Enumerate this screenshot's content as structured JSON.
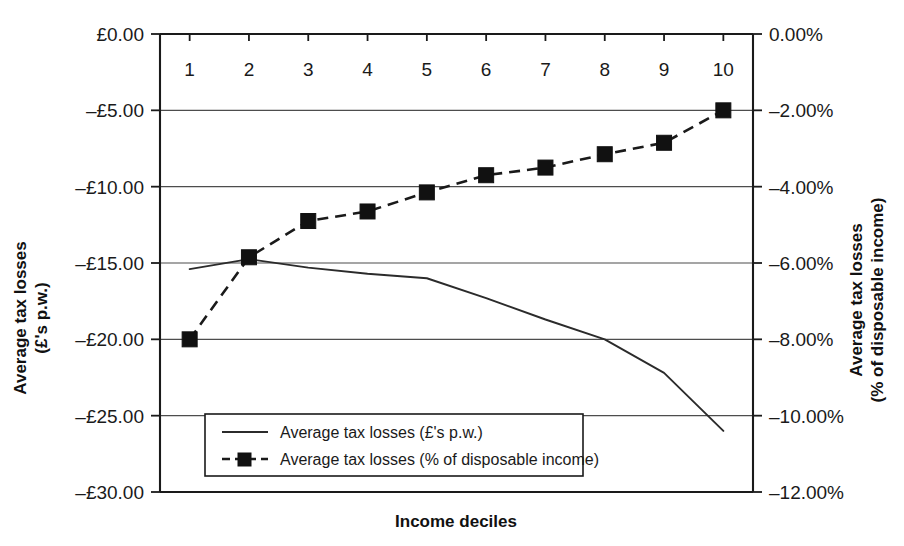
{
  "chart_data": {
    "type": "line",
    "title": "",
    "xlabel": "Income deciles",
    "categories": [
      "1",
      "2",
      "3",
      "4",
      "5",
      "6",
      "7",
      "8",
      "9",
      "10"
    ],
    "grid": true,
    "legend_position": "inside-bottom-left",
    "axes": {
      "left": {
        "label_line1": "Average tax losses",
        "label_line2": "(£'s p.w.)",
        "ylim": [
          -30.0,
          0.0
        ],
        "tick_values": [
          0.0,
          -5.0,
          -10.0,
          -15.0,
          -20.0,
          -25.0,
          -30.0
        ],
        "tick_labels": [
          "£0.00",
          "–£5.00",
          "–£10.00",
          "–£15.00",
          "–£20.00",
          "–£25.00",
          "–£30.00"
        ]
      },
      "right": {
        "label_line1": "Average tax losses",
        "label_line2": "(% of disposable income)",
        "ylim": [
          -12.0,
          0.0
        ],
        "tick_values": [
          0.0,
          -2.0,
          -4.0,
          -6.0,
          -8.0,
          -10.0,
          -12.0
        ],
        "tick_labels": [
          "0.00%",
          "–2.00%",
          "–4.00%",
          "–6.00%",
          "–8.00%",
          "–10.00%",
          "–12.00%"
        ]
      }
    },
    "series": [
      {
        "name": "Average tax losses (£'s p.w.)",
        "axis": "left",
        "style": "solid",
        "marker": "none",
        "color": "#2b2b2b",
        "x": [
          1,
          2,
          3,
          4,
          5,
          6,
          7,
          8,
          9,
          10
        ],
        "values": [
          -15.4,
          -14.75,
          -15.3,
          -15.7,
          -16.0,
          -17.3,
          -18.7,
          -20.0,
          -22.2,
          -26.0
        ]
      },
      {
        "name": "Average tax losses (% of disposable income)",
        "axis": "right",
        "style": "dashed",
        "marker": "square",
        "color": "#111111",
        "x": [
          1,
          2,
          3,
          4,
          5,
          6,
          7,
          8,
          9,
          10
        ],
        "values": [
          -8.0,
          -5.85,
          -4.9,
          -4.65,
          -4.15,
          -3.7,
          -3.5,
          -3.15,
          -2.85,
          -2.0
        ]
      }
    ],
    "legend": [
      {
        "label": "Average tax losses (£'s p.w.)",
        "style": "solid",
        "marker": "none"
      },
      {
        "label": "Average tax losses (% of disposable income)",
        "style": "dashed",
        "marker": "square"
      }
    ]
  }
}
